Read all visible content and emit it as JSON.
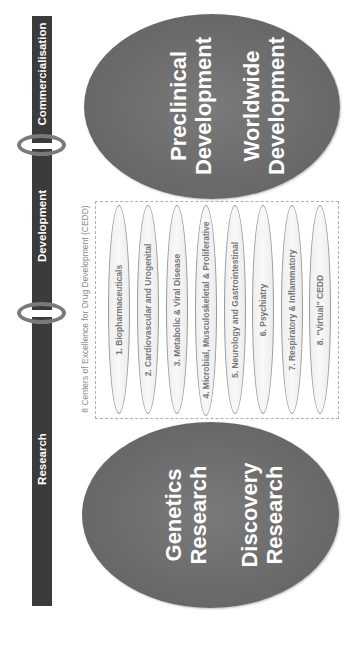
{
  "phase_bar": {
    "color": "#3b3b3b",
    "phases": [
      {
        "label": "Commercialisation"
      },
      {
        "label": "Development"
      },
      {
        "label": "Research"
      }
    ],
    "connector_color": "#7a7a7a"
  },
  "top_ellipse": {
    "lines": [
      "Preclinical",
      "Development",
      "Worldwide",
      "Development"
    ],
    "groups": [
      {
        "line1": "Preclinical",
        "line2": "Development"
      },
      {
        "line1": "Worldwide",
        "line2": "Development"
      }
    ],
    "color": "#6b6b6b"
  },
  "bottom_ellipse": {
    "groups": [
      {
        "line1": "Genetics",
        "line2": "Research"
      },
      {
        "line1": "Discovery",
        "line2": "Research"
      }
    ],
    "color": "#6b6b6b"
  },
  "cedd": {
    "caption": "8 Centers of Excellence for Drug Development (CEDD)",
    "centers": [
      {
        "label": "1. Biopharmaceuticals"
      },
      {
        "label": "2. Cardiovascular and Urogenital"
      },
      {
        "label": "3. Metabolic & Viral Disease"
      },
      {
        "label": "4. Microbial, Musculoskeletal & Proliferative"
      },
      {
        "label": "5. Neurology and Gastrointestinal"
      },
      {
        "label": "6. Psychiatry"
      },
      {
        "label": "7. Respiratory & Inflammatory"
      },
      {
        "label": "8. \"Virtual\" CEDD"
      }
    ]
  }
}
